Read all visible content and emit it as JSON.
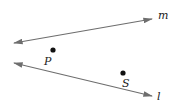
{
  "diagram": {
    "lines": [
      {
        "name": "m",
        "label": "m"
      },
      {
        "name": "l",
        "label": "l"
      }
    ],
    "points": [
      {
        "name": "P",
        "label": "P"
      },
      {
        "name": "S",
        "label": "S"
      }
    ],
    "colors": {
      "line": "#6e6e6e",
      "point": "#111111",
      "text": "#222222"
    }
  }
}
